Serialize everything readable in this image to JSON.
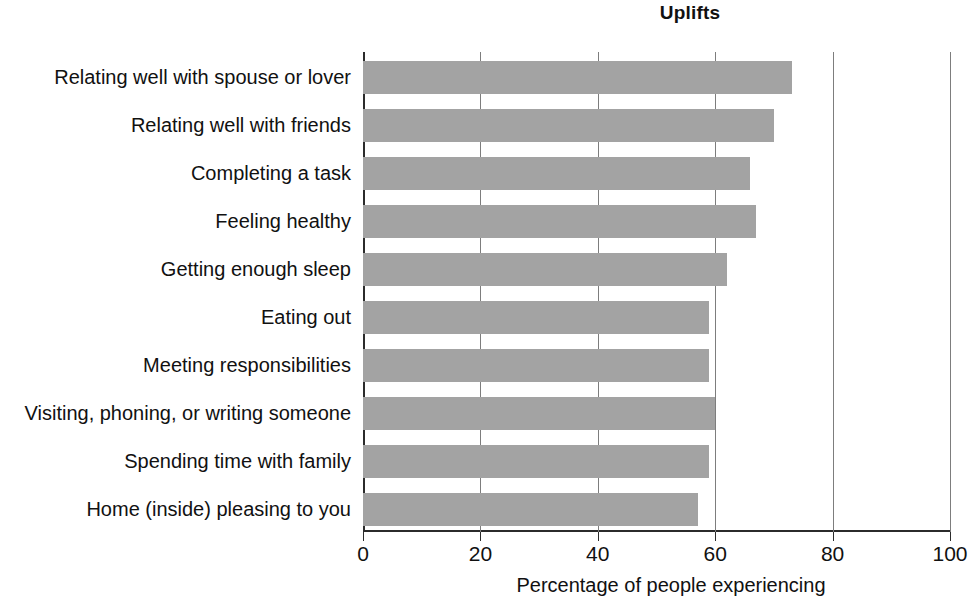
{
  "chart_data": {
    "type": "bar",
    "orientation": "horizontal",
    "title": "Uplifts",
    "xlabel": "Percentage of people experiencing",
    "ylabel": "",
    "xlim": [
      0,
      100
    ],
    "xticks": [
      0,
      20,
      40,
      60,
      80,
      100
    ],
    "xtick_labels": [
      "0",
      "20",
      "40",
      "60",
      "80",
      "100"
    ],
    "grid": "vertical gridlines at 20, 40, 60, 80, 100",
    "legend": "none",
    "bar_color": "#a3a3a3",
    "axis_color": "#2b2b2b",
    "categories": [
      "Relating well with spouse or lover",
      "Relating well with friends",
      "Completing a task",
      "Feeling healthy",
      "Getting enough sleep",
      "Eating out",
      "Meeting responsibilities",
      "Visiting, phoning, or writing someone",
      "Spending time with family",
      "Home (inside) pleasing to you"
    ],
    "values": [
      73,
      70,
      66,
      67,
      62,
      59,
      59,
      60,
      59,
      57
    ]
  }
}
